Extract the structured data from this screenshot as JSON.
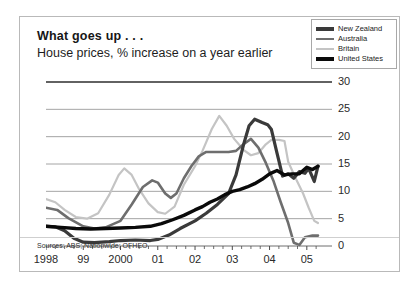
{
  "figure": {
    "title": "What goes up . . .",
    "subtitle": "House prices, % increase on a year earlier",
    "sources": "Sources: ABS; Nationwide; OFHEO"
  },
  "legend": {
    "position": "top-right",
    "items": [
      {
        "label": "New Zealand",
        "color": "#3a3a3a",
        "width": 3.2
      },
      {
        "label": "Australia",
        "color": "#6e6e6e",
        "width": 2.6
      },
      {
        "label": "Britain",
        "color": "#c4c4c4",
        "width": 2.2
      },
      {
        "label": "United States",
        "color": "#0a0a0a",
        "width": 3.4
      }
    ]
  },
  "axes": {
    "ytick_labels": [
      "30",
      "25",
      "20",
      "15",
      "10",
      "5",
      "0"
    ],
    "ytick_values": [
      30,
      25,
      20,
      15,
      10,
      5,
      0
    ],
    "xtick_labels": [
      "1998",
      "99",
      "2000",
      "01",
      "02",
      "03",
      "04",
      "05"
    ],
    "xtick_values": [
      1998,
      1999,
      2000,
      2001,
      2002,
      2003,
      2004,
      2005
    ],
    "grid": true,
    "ylim": [
      0,
      30
    ],
    "xlim": [
      1998,
      2005.3
    ]
  },
  "chart_data": {
    "type": "line",
    "title": "What goes up . . .",
    "subtitle": "House prices, % increase on a year earlier",
    "xlabel": "",
    "ylabel": "% increase on a year earlier",
    "ylim": [
      0,
      30
    ],
    "xlim": [
      1998,
      2005.3
    ],
    "grid": true,
    "legend_position": "top-right",
    "annotations": [
      "Sources: ABS; Nationwide; OFHEO"
    ],
    "series": [
      {
        "name": "New Zealand",
        "color": "#3a3a3a",
        "points": [
          [
            1998.0,
            3.6
          ],
          [
            1998.25,
            3.5
          ],
          [
            1998.5,
            2.8
          ],
          [
            1998.75,
            1.4
          ],
          [
            1999.0,
            0.7
          ],
          [
            1999.3,
            0.6
          ],
          [
            1999.7,
            0.8
          ],
          [
            2000.0,
            1.0
          ],
          [
            2000.4,
            1.1
          ],
          [
            2000.8,
            1.0
          ],
          [
            2001.0,
            1.2
          ],
          [
            2001.3,
            2.0
          ],
          [
            2001.6,
            3.2
          ],
          [
            2002.0,
            4.6
          ],
          [
            2002.3,
            6.0
          ],
          [
            2002.6,
            7.6
          ],
          [
            2002.9,
            9.6
          ],
          [
            2003.1,
            13.0
          ],
          [
            2003.3,
            18.5
          ],
          [
            2003.45,
            22.0
          ],
          [
            2003.6,
            23.2
          ],
          [
            2003.8,
            22.6
          ],
          [
            2003.95,
            22.2
          ],
          [
            2004.05,
            21.3
          ],
          [
            2004.2,
            17.0
          ],
          [
            2004.35,
            12.8
          ],
          [
            2004.5,
            13.2
          ],
          [
            2004.65,
            12.4
          ],
          [
            2004.8,
            13.6
          ],
          [
            2004.95,
            13.3
          ],
          [
            2005.05,
            14.2
          ],
          [
            2005.2,
            11.8
          ],
          [
            2005.3,
            14.6
          ]
        ]
      },
      {
        "name": "Australia",
        "color": "#6e6e6e",
        "points": [
          [
            1998.0,
            7.0
          ],
          [
            1998.3,
            6.6
          ],
          [
            1998.6,
            5.1
          ],
          [
            1999.0,
            3.6
          ],
          [
            1999.3,
            3.2
          ],
          [
            1999.6,
            3.4
          ],
          [
            2000.0,
            4.6
          ],
          [
            2000.3,
            7.6
          ],
          [
            2000.6,
            10.8
          ],
          [
            2000.85,
            12.0
          ],
          [
            2001.0,
            11.6
          ],
          [
            2001.2,
            9.6
          ],
          [
            2001.35,
            8.8
          ],
          [
            2001.5,
            9.6
          ],
          [
            2001.7,
            12.4
          ],
          [
            2001.9,
            14.6
          ],
          [
            2002.1,
            16.4
          ],
          [
            2002.3,
            17.2
          ],
          [
            2002.6,
            17.2
          ],
          [
            2002.9,
            17.2
          ],
          [
            2003.1,
            17.4
          ],
          [
            2003.3,
            18.6
          ],
          [
            2003.5,
            19.6
          ],
          [
            2003.7,
            18.0
          ],
          [
            2003.9,
            15.2
          ],
          [
            2004.1,
            12.0
          ],
          [
            2004.3,
            8.0
          ],
          [
            2004.5,
            4.2
          ],
          [
            2004.65,
            0.6
          ],
          [
            2004.8,
            0.2
          ],
          [
            2004.95,
            1.6
          ],
          [
            2005.15,
            1.9
          ],
          [
            2005.3,
            1.9
          ]
        ]
      },
      {
        "name": "Britain",
        "color": "#c4c4c4",
        "points": [
          [
            1998.0,
            8.6
          ],
          [
            1998.25,
            8.0
          ],
          [
            1998.5,
            6.6
          ],
          [
            1998.8,
            5.3
          ],
          [
            1999.1,
            5.0
          ],
          [
            1999.4,
            6.0
          ],
          [
            1999.7,
            9.4
          ],
          [
            1999.95,
            13.0
          ],
          [
            2000.1,
            14.2
          ],
          [
            2000.3,
            13.0
          ],
          [
            2000.5,
            10.4
          ],
          [
            2000.75,
            7.8
          ],
          [
            2001.0,
            6.2
          ],
          [
            2001.2,
            5.9
          ],
          [
            2001.45,
            7.2
          ],
          [
            2001.7,
            11.2
          ],
          [
            2002.0,
            14.6
          ],
          [
            2002.2,
            17.4
          ],
          [
            2002.45,
            21.4
          ],
          [
            2002.65,
            23.8
          ],
          [
            2002.85,
            22.0
          ],
          [
            2003.05,
            19.6
          ],
          [
            2003.3,
            17.6
          ],
          [
            2003.5,
            16.6
          ],
          [
            2003.7,
            17.0
          ],
          [
            2003.9,
            18.6
          ],
          [
            2004.05,
            19.4
          ],
          [
            2004.25,
            19.4
          ],
          [
            2004.4,
            19.2
          ],
          [
            2004.5,
            15.4
          ],
          [
            2004.7,
            12.4
          ],
          [
            2004.9,
            9.6
          ],
          [
            2005.05,
            7.0
          ],
          [
            2005.2,
            4.6
          ],
          [
            2005.3,
            4.2
          ]
        ]
      },
      {
        "name": "United States",
        "color": "#0a0a0a",
        "points": [
          [
            1998.0,
            3.6
          ],
          [
            1998.4,
            3.4
          ],
          [
            1998.8,
            3.2
          ],
          [
            1999.2,
            3.1
          ],
          [
            1999.6,
            3.2
          ],
          [
            2000.0,
            3.3
          ],
          [
            2000.4,
            3.4
          ],
          [
            2000.8,
            3.6
          ],
          [
            2001.1,
            4.1
          ],
          [
            2001.4,
            4.8
          ],
          [
            2001.7,
            5.6
          ],
          [
            2002.0,
            6.6
          ],
          [
            2002.2,
            7.2
          ],
          [
            2002.4,
            8.0
          ],
          [
            2002.6,
            8.6
          ],
          [
            2002.8,
            9.4
          ],
          [
            2003.0,
            10.0
          ],
          [
            2003.2,
            10.3
          ],
          [
            2003.4,
            10.8
          ],
          [
            2003.6,
            11.4
          ],
          [
            2003.8,
            12.2
          ],
          [
            2004.0,
            13.2
          ],
          [
            2004.2,
            13.8
          ],
          [
            2004.4,
            13.0
          ],
          [
            2004.6,
            13.2
          ],
          [
            2004.8,
            13.2
          ],
          [
            2005.0,
            14.4
          ],
          [
            2005.15,
            14.0
          ],
          [
            2005.3,
            14.6
          ]
        ]
      }
    ]
  }
}
